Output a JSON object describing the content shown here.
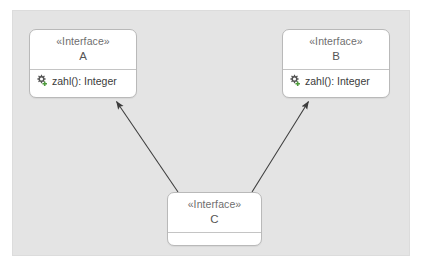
{
  "diagram": {
    "type": "uml-class-diagram",
    "canvas_color": "#e4e4e4",
    "class_fill_color": "#ffffff",
    "class_border_color": "#b9b9b9",
    "text_color": "#555555",
    "member_text_color": "#3b3b3b",
    "edge_color": "#3c3c3c",
    "classes": [
      {
        "id": "A",
        "stereotype": "«Interface»",
        "name": "A",
        "operations": [
          {
            "icon": "gear-public-operation-icon",
            "label": "zahl(): Integer"
          }
        ]
      },
      {
        "id": "B",
        "stereotype": "«Interface»",
        "name": "B",
        "operations": [
          {
            "icon": "gear-public-operation-icon",
            "label": "zahl(): Integer"
          }
        ]
      },
      {
        "id": "C",
        "stereotype": "«Interface»",
        "name": "C",
        "operations": []
      }
    ],
    "relationships": [
      {
        "from": "C",
        "to": "A",
        "kind": "generalization",
        "arrowhead": "filled-triangle"
      },
      {
        "from": "C",
        "to": "B",
        "kind": "generalization",
        "arrowhead": "filled-triangle"
      }
    ]
  }
}
